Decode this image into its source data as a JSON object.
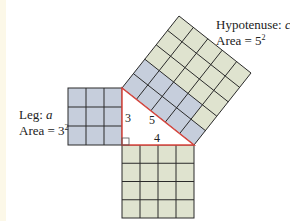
{
  "diagram": {
    "labels": {
      "leg": {
        "line1_prefix": "Leg: ",
        "line1_var": "a",
        "line2_prefix": "Area = ",
        "line2_base": "3",
        "line2_exp": "2"
      },
      "hypotenuse": {
        "line1_prefix": "Hypotenuse: ",
        "line1_var": "c",
        "line2_prefix": "Area = ",
        "line2_base": "5",
        "line2_exp": "2"
      }
    },
    "triangle": {
      "side_a": "3",
      "side_b": "4",
      "side_c": "5",
      "vertices": {
        "top": [
          122,
          88
        ],
        "right_angle": [
          122,
          145
        ],
        "right": [
          194,
          145
        ]
      },
      "edge_color": "#d9473f"
    },
    "squares": [
      {
        "name": "leg-a-square",
        "side": 3,
        "cells": 9,
        "fill": "#c6cedc"
      },
      {
        "name": "leg-b-square",
        "side": 4,
        "cells": 16,
        "fill": "#dfe3cf"
      },
      {
        "name": "hypotenuse-square",
        "side": 5,
        "cells": 25,
        "fill": "#dfe3cf",
        "highlight_cells": 9,
        "highlight_fill": "#c6cedc"
      }
    ],
    "colors": {
      "grid_line": "#2a2a2a",
      "blue": "#c6cedc",
      "green": "#dfe3cf",
      "red": "#d9473f"
    }
  }
}
